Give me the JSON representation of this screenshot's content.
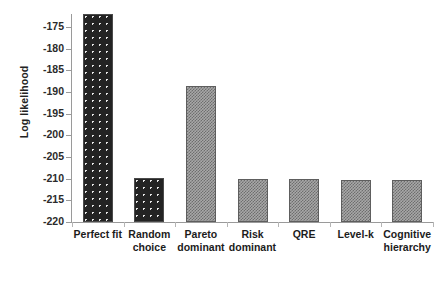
{
  "chart_data": {
    "type": "bar",
    "title": "",
    "xlabel": "",
    "ylabel": "Log likelihood",
    "categories": [
      "Perfect fit",
      "Random choice",
      "Pareto dominant",
      "Risk dominant",
      "QRE",
      "Level-k",
      "Cognitive hierarchy"
    ],
    "category_lines": [
      [
        "Perfect fit"
      ],
      [
        "Random",
        "choice"
      ],
      [
        "Pareto",
        "dominant"
      ],
      [
        "Risk",
        "dominant"
      ],
      [
        "QRE"
      ],
      [
        "Level-k"
      ],
      [
        "Cognitive",
        "hierarchy"
      ]
    ],
    "values": [
      -172.0,
      -209.9,
      -188.5,
      -210.0,
      -210.1,
      -210.2,
      -210.4
    ],
    "ylim": [
      -220,
      -172
    ],
    "yticks": [
      -175,
      -180,
      -185,
      -190,
      -195,
      -200,
      -205,
      -210,
      -215,
      -220
    ],
    "ytick_labels": [
      "-175",
      "-180",
      "-185",
      "-190",
      "-195",
      "-200",
      "-205",
      "-210",
      "-215",
      "-220"
    ],
    "grid": false,
    "legend": null,
    "bar_styles": [
      "dark",
      "dark",
      "gray",
      "gray",
      "gray",
      "gray",
      "gray"
    ],
    "colors": {
      "dark_fill": "#232323",
      "dark_dots": "#e9e9e9",
      "gray_fill": "#a8a8a8",
      "gray_pattern": "#6e6e6e",
      "axis": "#9a9a9a",
      "text": "#1c1c1c",
      "background": "#ffffff"
    }
  }
}
